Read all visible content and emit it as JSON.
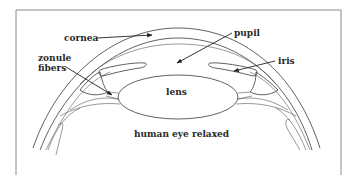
{
  "diagram": {
    "title": "human eye relaxed",
    "labels": {
      "cornea": "cornea",
      "pupil": "pupil",
      "zonule_line1": "zonule",
      "zonule_line2": "fibers",
      "iris": "iris",
      "lens": "lens"
    },
    "colors": {
      "line": "#3a3a3a",
      "frame": "#8a8a8a",
      "text": "#2a2a2a",
      "background": "#ffffff"
    }
  }
}
